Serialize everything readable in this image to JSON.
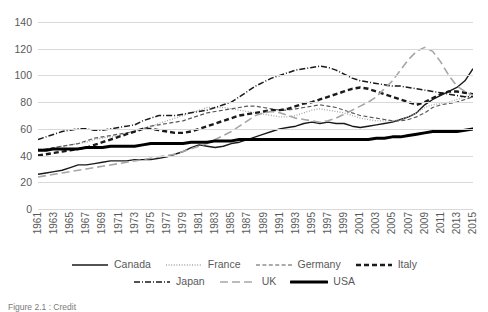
{
  "chart_data": {
    "type": "line",
    "title": "",
    "xlabel": "",
    "ylabel": "",
    "ylim": [
      0,
      140
    ],
    "ytick_step": 20,
    "yticks": [
      0,
      20,
      40,
      60,
      80,
      100,
      120,
      140
    ],
    "grid": true,
    "legend_position": "bottom",
    "x": [
      1961,
      1962,
      1963,
      1964,
      1965,
      1966,
      1967,
      1968,
      1969,
      1970,
      1971,
      1972,
      1973,
      1974,
      1975,
      1976,
      1977,
      1978,
      1979,
      1980,
      1981,
      1982,
      1983,
      1984,
      1985,
      1986,
      1987,
      1988,
      1989,
      1990,
      1991,
      1992,
      1993,
      1994,
      1995,
      1996,
      1997,
      1998,
      1999,
      2000,
      2001,
      2002,
      2003,
      2004,
      2005,
      2006,
      2007,
      2008,
      2009,
      2010,
      2011,
      2012,
      2013,
      2014,
      2015
    ],
    "xtick_labels": [
      "1961",
      "1963",
      "1965",
      "1967",
      "1969",
      "1971",
      "1973",
      "1975",
      "1977",
      "1979",
      "1981",
      "1983",
      "1985",
      "1987",
      "1989",
      "1991",
      "1993",
      "1995",
      "1997",
      "1999",
      "2001",
      "2003",
      "2005",
      "2007",
      "2009",
      "2011",
      "2013",
      "2015"
    ],
    "series": [
      {
        "name": "Canada",
        "style": "solid-thin",
        "color": "#1a1a1a",
        "values": [
          26,
          27,
          28,
          29,
          31,
          33,
          33,
          34,
          35,
          36,
          36,
          36,
          37,
          37,
          37,
          38,
          39,
          41,
          43,
          46,
          48,
          47,
          46,
          47,
          49,
          50,
          52,
          54,
          56,
          58,
          60,
          61,
          62,
          64,
          65,
          64,
          65,
          64,
          64,
          62,
          61,
          62,
          63,
          64,
          65,
          67,
          69,
          72,
          78,
          82,
          85,
          88,
          91,
          96,
          105
        ]
      },
      {
        "name": "France",
        "style": "dotted",
        "color": "#a6a6a6",
        "values": [
          45,
          45,
          46,
          47,
          48,
          49,
          50,
          52,
          53,
          54,
          55,
          57,
          58,
          60,
          62,
          64,
          66,
          68,
          70,
          72,
          74,
          76,
          76,
          76,
          75,
          74,
          73,
          72,
          71,
          70,
          69,
          69,
          70,
          72,
          74,
          75,
          74,
          73,
          72,
          70,
          68,
          67,
          66,
          66,
          66,
          67,
          69,
          72,
          76,
          78,
          79,
          80,
          82,
          84,
          86
        ]
      },
      {
        "name": "Germany",
        "style": "dashed",
        "color": "#595959",
        "values": [
          44,
          45,
          46,
          47,
          48,
          49,
          51,
          53,
          54,
          55,
          56,
          57,
          58,
          60,
          62,
          63,
          64,
          65,
          66,
          68,
          70,
          72,
          73,
          74,
          75,
          76,
          77,
          77,
          76,
          75,
          74,
          74,
          75,
          76,
          77,
          78,
          77,
          76,
          74,
          72,
          70,
          69,
          68,
          67,
          66,
          66,
          67,
          69,
          72,
          76,
          78,
          79,
          80,
          82,
          84
        ]
      },
      {
        "name": "Italy",
        "style": "bold-dash",
        "color": "#1a1a1a",
        "values": [
          40,
          41,
          42,
          43,
          44,
          45,
          46,
          48,
          50,
          52,
          54,
          56,
          58,
          60,
          60,
          59,
          58,
          57,
          57,
          58,
          60,
          62,
          64,
          66,
          68,
          70,
          71,
          72,
          73,
          74,
          74,
          75,
          77,
          79,
          80,
          82,
          84,
          86,
          88,
          90,
          91,
          90,
          88,
          86,
          84,
          82,
          80,
          78,
          80,
          83,
          86,
          88,
          88,
          87,
          86
        ]
      },
      {
        "name": "Japan",
        "style": "dash-dot",
        "color": "#1a1a1a",
        "values": [
          52,
          54,
          56,
          58,
          59,
          60,
          60,
          59,
          59,
          60,
          61,
          62,
          63,
          66,
          68,
          70,
          70,
          70,
          71,
          72,
          73,
          74,
          76,
          78,
          80,
          84,
          88,
          92,
          95,
          98,
          100,
          102,
          104,
          105,
          106,
          107,
          106,
          104,
          101,
          98,
          96,
          95,
          94,
          93,
          92,
          92,
          91,
          90,
          89,
          88,
          87,
          86,
          85,
          84,
          84
        ]
      },
      {
        "name": "UK",
        "style": "long-dash",
        "color": "#a6a6a6",
        "values": [
          24,
          25,
          26,
          27,
          28,
          29,
          30,
          31,
          32,
          33,
          34,
          35,
          36,
          37,
          38,
          39,
          40,
          41,
          43,
          45,
          47,
          49,
          52,
          55,
          58,
          62,
          66,
          70,
          72,
          73,
          72,
          70,
          68,
          67,
          66,
          65,
          66,
          68,
          71,
          74,
          77,
          80,
          84,
          90,
          96,
          104,
          112,
          118,
          121,
          118,
          110,
          100,
          92,
          88,
          85
        ]
      },
      {
        "name": "USA",
        "style": "solid-thick",
        "color": "#000000",
        "values": [
          44,
          44,
          45,
          45,
          45,
          45,
          46,
          46,
          46,
          47,
          47,
          47,
          47,
          48,
          49,
          49,
          49,
          49,
          49,
          50,
          50,
          50,
          51,
          51,
          51,
          52,
          52,
          52,
          52,
          52,
          52,
          52,
          52,
          52,
          52,
          52,
          52,
          52,
          52,
          52,
          52,
          52,
          53,
          53,
          54,
          54,
          55,
          56,
          57,
          58,
          58,
          58,
          58,
          59,
          60
        ]
      }
    ]
  },
  "legend": {
    "items": [
      {
        "label": "Canada",
        "style": "solid-thin"
      },
      {
        "label": "France",
        "style": "dotted"
      },
      {
        "label": "Germany",
        "style": "dashed"
      },
      {
        "label": "Italy",
        "style": "bold-dash"
      },
      {
        "label": "Japan",
        "style": "dash-dot"
      },
      {
        "label": "UK",
        "style": "long-dash"
      },
      {
        "label": "USA",
        "style": "solid-thick"
      }
    ]
  },
  "caption": {
    "text": "Figure 2.1 : Credit"
  },
  "colors": {
    "gridline": "#d9d9d9",
    "axis_text": "#595959",
    "dark_line": "#1a1a1a",
    "gray_line": "#a6a6a6"
  }
}
